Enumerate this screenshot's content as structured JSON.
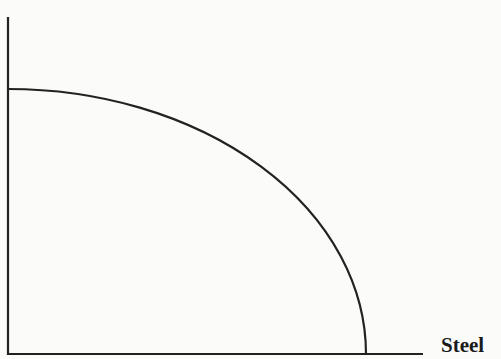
{
  "chart_data": {
    "type": "line",
    "title": "",
    "xlabel": "Steel",
    "ylabel": "",
    "grid": false,
    "legend": null,
    "x": [
      0,
      0.2,
      0.4,
      0.6,
      0.8,
      0.9,
      1.0
    ],
    "series": [
      {
        "name": "PPF",
        "values": [
          1.0,
          0.98,
          0.917,
          0.8,
          0.6,
          0.436,
          0.0
        ]
      }
    ],
    "xlim": [
      0,
      1.16
    ],
    "ylim": [
      0,
      1.27
    ],
    "ticks": {
      "x": [],
      "y": []
    }
  },
  "colors": {
    "line": "#222222",
    "axis": "#222222",
    "background": "#fbfbfa"
  }
}
